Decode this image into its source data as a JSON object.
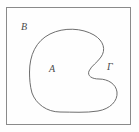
{
  "figure": {
    "name": "set-diagram-closed-curve",
    "background_color": "#fefefe",
    "outer_rect": {
      "name": "universe-boundary-rectangle",
      "x": 6,
      "y": 7,
      "width": 125,
      "height": 118,
      "stroke_color": "#8a8a8a",
      "stroke_width": 1,
      "fill": "none"
    },
    "curve": {
      "name": "jordan-curve",
      "stroke_color": "#6e6e6e",
      "stroke_width": 1,
      "fill": "none",
      "path": "M 29.5 72 C 29.5 55, 36 41, 50 34 C 64 27, 82 28, 94 35 C 104 41, 106 50, 101 57 C 97 63, 92 65, 89 71 C 87 76, 92 79, 99 79 C 108 79, 116 84, 117 92 C 118 101, 110 109, 98 111 C 86 113, 72 112, 60 112 C 47 112, 36 104, 32 93 C 30 86, 29.5 79, 29.5 72 Z"
    },
    "labels": [
      {
        "id": "B",
        "text": "B",
        "role": "exterior-region-label",
        "x": 21,
        "y": 22,
        "color": "#4a4a4a"
      },
      {
        "id": "A",
        "text": "A",
        "role": "interior-region-label",
        "x": 49,
        "y": 64,
        "color": "#4a4a4a"
      },
      {
        "id": "G",
        "text": "Γ",
        "role": "curve-label",
        "x": 107,
        "y": 62,
        "color": "#4a4a4a"
      }
    ]
  }
}
